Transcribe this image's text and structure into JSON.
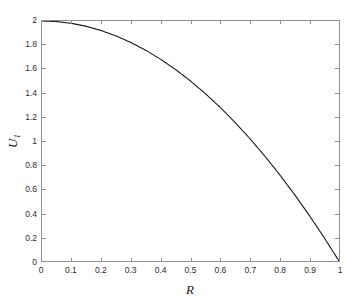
{
  "chart_data": {
    "type": "line",
    "title": "",
    "subtitle": "",
    "xlabel": "R",
    "ylabel": "U",
    "ylabel_sub": "1",
    "xlim": [
      0,
      1
    ],
    "ylim": [
      0,
      2
    ],
    "grid": false,
    "legend": null,
    "xticks": [
      "0",
      "0.1",
      "0.2",
      "0.3",
      "0.4",
      "0.5",
      "0.6",
      "0.7",
      "0.8",
      "0.9",
      "1"
    ],
    "xtick_values": [
      0,
      0.1,
      0.2,
      0.3,
      0.4,
      0.5,
      0.6,
      0.7,
      0.8,
      0.9,
      1
    ],
    "yticks": [
      "0",
      "0.2",
      "0.4",
      "0.6",
      "0.8",
      "1",
      "1.2",
      "1.4",
      "1.6",
      "1.8",
      "2"
    ],
    "ytick_values": [
      0,
      0.2,
      0.4,
      0.6,
      0.8,
      1,
      1.2,
      1.4,
      1.6,
      1.8,
      2
    ],
    "series": [
      {
        "name": "U1",
        "color": "#1a1a1a",
        "line_width": 1,
        "x": [
          0,
          0.05,
          0.1,
          0.15,
          0.2,
          0.25,
          0.3,
          0.35,
          0.4,
          0.45,
          0.5,
          0.55,
          0.6,
          0.65,
          0.7,
          0.75,
          0.8,
          0.85,
          0.9,
          0.95,
          1
        ],
        "values": [
          2.0,
          1.995,
          1.98,
          1.955,
          1.92,
          1.875,
          1.82,
          1.755,
          1.68,
          1.595,
          1.5,
          1.395,
          1.28,
          1.155,
          1.02,
          0.875,
          0.72,
          0.555,
          0.38,
          0.195,
          0.0
        ]
      }
    ],
    "axis_color": "#8f8f8f",
    "background_color": "#ffffff"
  }
}
